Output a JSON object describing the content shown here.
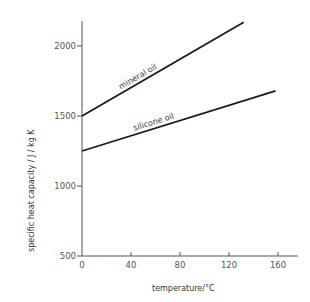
{
  "chart_data": {
    "type": "line",
    "title": "",
    "xlabel": "temperature/°C",
    "ylabel": "specific heat capacity / J / kg K",
    "xlim": [
      0,
      175
    ],
    "ylim": [
      500,
      2230
    ],
    "x_ticks": [
      0,
      40,
      80,
      120,
      160
    ],
    "y_ticks": [
      500,
      1000,
      1500,
      2000
    ],
    "x_tick_labels": [
      "0",
      "40",
      "80",
      "120",
      "160"
    ],
    "y_tick_labels": [
      "500",
      "1000",
      "1500",
      "2000"
    ],
    "grid": false,
    "legend": "inline labels on lines",
    "series": [
      {
        "name": "mineral oil",
        "x": [
          0,
          132
        ],
        "values": [
          1500,
          2170
        ]
      },
      {
        "name": "silicone oil",
        "x": [
          0,
          158
        ],
        "values": [
          1250,
          1680
        ]
      }
    ]
  },
  "colors": {
    "line": "#1a1a1a",
    "axis": "#555555",
    "background": "#ffffff"
  }
}
